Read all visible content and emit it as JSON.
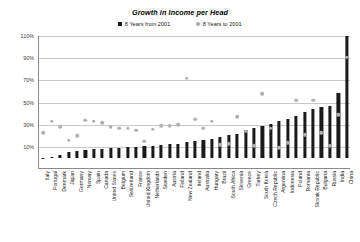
{
  "chart_data": {
    "type": "bar",
    "title": "Growth in Income per Head",
    "xlabel": "",
    "ylabel": "",
    "ylim": [
      -10,
      110
    ],
    "yticks": [
      "110%",
      "90%",
      "70%",
      "50%",
      "30%",
      "10%"
    ],
    "ytick_values": [
      110,
      90,
      70,
      50,
      30,
      10
    ],
    "grid": true,
    "legend_position": "top-center",
    "categories": [
      "Italy",
      "Portugal",
      "Denmark",
      "Japan",
      "Germany",
      "Norway",
      "Spain",
      "Canada",
      "United States",
      "Belgium",
      "Switzerland",
      "France",
      "United Kingdom",
      "Netherlands",
      "Sweden",
      "Austria",
      "Finland",
      "New Zealand",
      "Ireland",
      "Australia",
      "Hungary",
      "Brazil",
      "South Africa",
      "Slovenia",
      "Greece",
      "Turkey",
      "South Korea",
      "Czech Republic",
      "Argentina",
      "Indonesia",
      "Poland",
      "Romania",
      "Slovak Republic",
      "Bulgaria",
      "Russia",
      "India",
      "China"
    ],
    "series": [
      {
        "name": "8 Years from 2001",
        "marker": "bar",
        "color": "#1a1a1a",
        "values": [
          -1,
          1,
          3,
          5,
          6,
          7,
          8,
          8,
          9,
          9,
          10,
          10,
          11,
          11,
          12,
          13,
          13,
          14,
          15,
          16,
          17,
          19,
          21,
          22,
          25,
          27,
          29,
          31,
          33,
          35,
          38,
          41,
          44,
          46,
          47,
          59,
          110
        ]
      },
      {
        "name": "8 Years to 2001",
        "marker": "dot",
        "color": "#b0b0b0",
        "values": [
          22,
          32,
          27,
          15,
          19,
          33,
          32,
          31,
          27,
          26,
          26,
          24,
          14,
          25,
          28,
          28,
          29,
          71,
          34,
          26,
          32,
          11,
          12,
          36,
          23,
          10,
          57,
          26,
          8,
          13,
          51,
          20,
          51,
          22,
          10,
          38,
          90
        ]
      }
    ]
  },
  "legend": {
    "items": [
      {
        "label": "8 Years from 2001"
      },
      {
        "label": "8 Years to 2001"
      }
    ]
  }
}
